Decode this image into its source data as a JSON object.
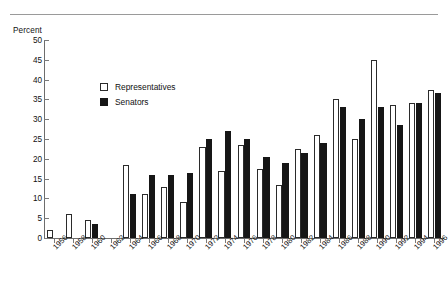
{
  "figure": {
    "y_axis_title": "Percent"
  },
  "legend": {
    "items": [
      {
        "label": "Representatives",
        "swatch": "open-square-icon",
        "color": "#ffffff"
      },
      {
        "label": "Senators",
        "swatch": "filled-square-icon",
        "color": "#161616"
      }
    ]
  },
  "chart_data": {
    "type": "bar",
    "title": "",
    "subtitle": "",
    "xlabel": "",
    "ylabel": "Percent",
    "ylim": [
      0,
      50
    ],
    "yticks": [
      0,
      5,
      10,
      15,
      20,
      25,
      30,
      35,
      40,
      45,
      50
    ],
    "ytick_labels": [
      "0",
      "5",
      "10",
      "15",
      "20",
      "25",
      "30",
      "35",
      "40",
      "45",
      "50"
    ],
    "grid": false,
    "legend_position": "upper-left-inside",
    "categories": [
      "1956",
      "1958",
      "1960",
      "1962",
      "1964",
      "1966",
      "1968",
      "1970",
      "1972",
      "1974",
      "1976",
      "1978",
      "1980",
      "1982",
      "1984",
      "1986",
      "1988",
      "1990",
      "1992",
      "1994",
      "1996"
    ],
    "series": [
      {
        "name": "Representatives",
        "color": "#ffffff",
        "edge_color": "#2b2b2b",
        "values": [
          2,
          6,
          4.5,
          0,
          18.5,
          11,
          13,
          9,
          23,
          17,
          23.5,
          17.5,
          13.5,
          22.5,
          26,
          35,
          25,
          45,
          33.5,
          34,
          37.5
        ]
      },
      {
        "name": "Senators",
        "color": "#161616",
        "edge_color": "#161616",
        "values": [
          0,
          0,
          3.5,
          0,
          11,
          16,
          16,
          16.5,
          25,
          27,
          25,
          20.5,
          19,
          21.5,
          24,
          33,
          30,
          33,
          28.5,
          34,
          36.5
        ]
      }
    ]
  }
}
